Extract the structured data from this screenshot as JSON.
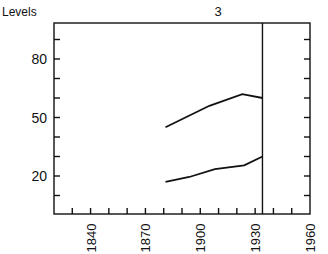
{
  "chart_data": {
    "type": "line",
    "title": "3",
    "ylabel": "Levels",
    "xlabel": "",
    "xlim": [
      1820,
      1960
    ],
    "ylim": [
      5,
      100
    ],
    "grid": false,
    "legend": null,
    "x_ticks": [
      1840,
      1870,
      1900,
      1930,
      1960
    ],
    "y_ticks": [
      20,
      50,
      80
    ],
    "x_minor_step": 10,
    "y_minor_step": 10,
    "reference_line": {
      "orientation": "vertical",
      "x": 1934
    },
    "series": [
      {
        "name": "upper",
        "x": [
          1881,
          1905,
          1923,
          1934
        ],
        "values": [
          45,
          56,
          62,
          60
        ]
      },
      {
        "name": "lower",
        "x": [
          1881,
          1894,
          1908,
          1924,
          1934
        ],
        "values": [
          17,
          19.5,
          23.5,
          25.5,
          30
        ]
      }
    ]
  }
}
